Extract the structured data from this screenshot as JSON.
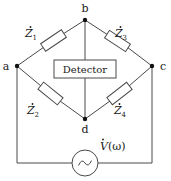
{
  "diagram": {
    "nodes": [
      {
        "id": "a",
        "label": "a",
        "x": 17,
        "y": 66
      },
      {
        "id": "b",
        "label": "b",
        "x": 85,
        "y": 20
      },
      {
        "id": "c",
        "label": "c",
        "x": 152,
        "y": 66
      },
      {
        "id": "d",
        "label": "d",
        "x": 85,
        "y": 119
      }
    ],
    "detector": {
      "label": "Detector",
      "x": 54,
      "y": 60,
      "width": 62,
      "height": 18
    },
    "impedances": [
      {
        "id": "z1",
        "symbol": "Z",
        "dot": "̇",
        "subscript": "1",
        "label": "Ż₁",
        "label_x": 31,
        "label_y": 37,
        "branch": "a-b"
      },
      {
        "id": "z3",
        "symbol": "Z",
        "dot": "̇",
        "subscript": "3",
        "label": "Ż₃",
        "label_x": 121,
        "label_y": 37,
        "branch": "b-c"
      },
      {
        "id": "z2",
        "symbol": "Z",
        "dot": "̇",
        "subscript": "2",
        "label": "Ż₂",
        "label_x": 33,
        "label_y": 114,
        "branch": "a-d"
      },
      {
        "id": "z4",
        "symbol": "Z",
        "dot": "̇",
        "subscript": "4",
        "label": "Ż₄",
        "label_x": 120,
        "label_y": 114,
        "branch": "d-c"
      }
    ],
    "source": {
      "type": "ac-voltage-source",
      "label_v": "V",
      "label_dot": "̇",
      "label_arg": "(ω)",
      "label": "V̇(ω)",
      "label_x": 100,
      "label_y": 150,
      "cx": 85,
      "cy": 163,
      "r": 13,
      "glyph": "sine-wave"
    },
    "colors": {
      "background": "#ffffff",
      "wire": "#4a4a4a",
      "text": "#1a1a1a",
      "node": "#111111",
      "component_fill": "#ffffff"
    }
  }
}
